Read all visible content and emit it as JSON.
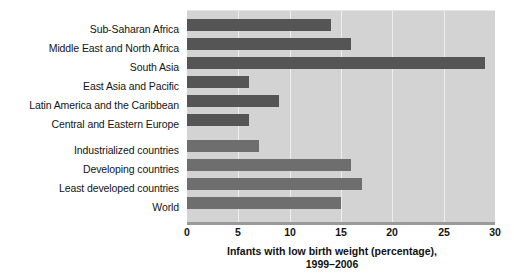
{
  "chart_data": {
    "type": "bar",
    "orientation": "horizontal",
    "title": "",
    "xlabel_line1": "Infants with low birth weight (percentage),",
    "xlabel_line2": "1999–2006",
    "ylabel": "",
    "xlim": [
      0,
      30
    ],
    "xticks": [
      0,
      5,
      10,
      15,
      20,
      25,
      30
    ],
    "xtick_labels": [
      "0",
      "5",
      "10",
      "15",
      "20",
      "25",
      "30"
    ],
    "grid": "vertical-white",
    "legend": "none",
    "categories": [
      "Sub-Saharan Africa",
      "Middle East and North Africa",
      "South Asia",
      "East Asia and Pacific",
      "Latin America and the Caribbean",
      "Central and Eastern Europe",
      "Industrialized countries",
      "Developing countries",
      "Least developed countries",
      "World"
    ],
    "values": [
      14,
      16,
      29,
      6,
      9,
      6,
      7,
      16,
      17,
      15
    ],
    "groups": [
      {
        "name": "regions",
        "categories": [
          "Sub-Saharan Africa",
          "Middle East and North Africa",
          "South Asia",
          "East Asia and Pacific",
          "Latin America and the Caribbean",
          "Central and Eastern Europe"
        ],
        "values": [
          14,
          16,
          29,
          6,
          9,
          6
        ],
        "color": "#555555"
      },
      {
        "name": "aggregates",
        "categories": [
          "Industrialized countries",
          "Developing countries",
          "Least developed countries",
          "World"
        ],
        "values": [
          7,
          16,
          17,
          15
        ],
        "color": "#6e6e6e"
      }
    ],
    "colors": {
      "plot_background": "#d3d3d3",
      "gridline": "#eeeeee",
      "bar_group_regions": "#555555",
      "bar_group_aggregates": "#6e6e6e",
      "axis_line": "#9a9a9a",
      "text": "#141414",
      "page_background": "#ffffff"
    }
  }
}
